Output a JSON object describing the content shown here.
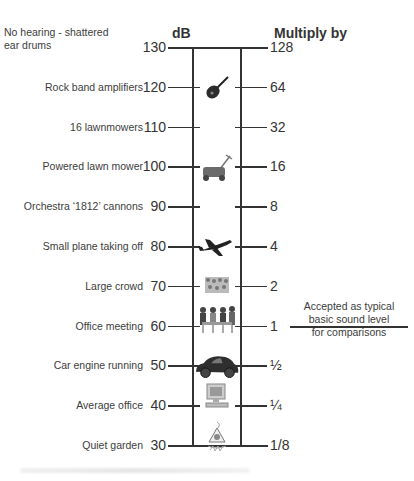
{
  "headers": {
    "db": "dB",
    "multiply": "Multiply by"
  },
  "rows": [
    {
      "desc": "No hearing - shattered ear drums",
      "db": "130",
      "mult": "128",
      "icon": "",
      "desc_lines": [
        "No hearing - shattered",
        "ear drums"
      ]
    },
    {
      "desc": "Rock band amplifiers",
      "db": "120",
      "mult": "64",
      "icon": "guitar-icon"
    },
    {
      "desc": "16 lawnmowers",
      "db": "110",
      "mult": "32",
      "icon": ""
    },
    {
      "desc": "Powered lawn mower",
      "db": "100",
      "mult": "16",
      "icon": "lawn-mower-icon"
    },
    {
      "desc": "Orchestra ‘1812’ cannons",
      "db": "90",
      "mult": "8",
      "icon": ""
    },
    {
      "desc": "Small plane taking off",
      "db": "80",
      "mult": "4",
      "icon": "airplane-icon"
    },
    {
      "desc": "Large crowd",
      "db": "70",
      "mult": "2",
      "icon": "crowd-icon"
    },
    {
      "desc": "Office meeting",
      "db": "60",
      "mult": "1",
      "icon": "meeting-icon"
    },
    {
      "desc": "Car engine running",
      "db": "50",
      "mult": "½",
      "icon": "car-icon"
    },
    {
      "desc": "Average office",
      "db": "40",
      "mult": "¼",
      "icon": "computer-icon"
    },
    {
      "desc": "Quiet garden",
      "db": "30",
      "mult": "1/8",
      "icon": "garden-gnome-icon"
    }
  ],
  "annotation": {
    "line1": "Accepted as typical",
    "line2": "basic sound level",
    "line3": "for comparisons"
  },
  "chart_data": {
    "type": "table",
    "columns": [
      "Sound source",
      "dB",
      "Multiply by"
    ],
    "rows": [
      [
        "No hearing - shattered ear drums",
        130,
        "128"
      ],
      [
        "Rock band amplifiers",
        120,
        "64"
      ],
      [
        "16 lawnmowers",
        110,
        "32"
      ],
      [
        "Powered lawn mower",
        100,
        "16"
      ],
      [
        "Orchestra '1812' cannons",
        90,
        "8"
      ],
      [
        "Small plane taking off",
        80,
        "4"
      ],
      [
        "Large crowd",
        70,
        "2"
      ],
      [
        "Office meeting",
        60,
        "1"
      ],
      [
        "Car engine running",
        50,
        "1/2"
      ],
      [
        "Average office",
        40,
        "1/4"
      ],
      [
        "Quiet garden",
        30,
        "1/8"
      ]
    ],
    "annotation": "60 dB (x1): Accepted as typical basic sound level for comparisons"
  }
}
